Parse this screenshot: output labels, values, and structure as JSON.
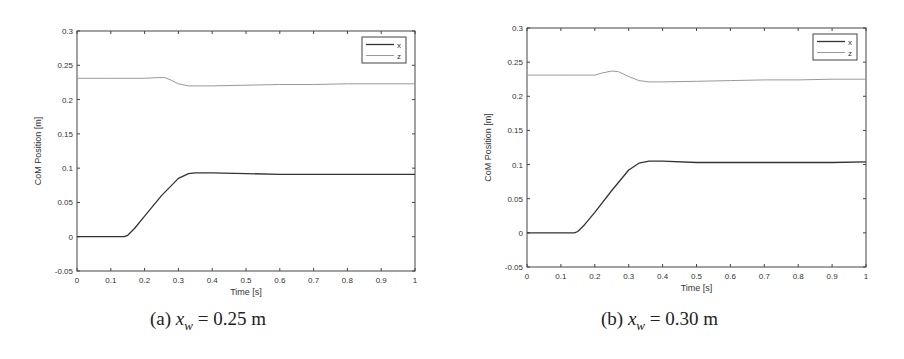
{
  "figures": [
    {
      "id": "a",
      "caption": {
        "label": "(a)",
        "var": "x",
        "sub": "w",
        "rest": "= 0.25 m"
      }
    },
    {
      "id": "b",
      "caption": {
        "label": "(b)",
        "var": "x",
        "sub": "w",
        "rest": "= 0.30 m"
      }
    }
  ],
  "chart_data": [
    {
      "type": "line",
      "title": "",
      "caption": "(a) x_w = 0.25 m",
      "xlabel": "Time [s]",
      "ylabel": "CoM Position [m]",
      "xlim": [
        0,
        1
      ],
      "ylim": [
        -0.05,
        0.3
      ],
      "xticks": [
        0,
        0.1,
        0.2,
        0.3,
        0.4,
        0.5,
        0.6,
        0.7,
        0.8,
        0.9,
        1
      ],
      "xtick_labels": [
        "0",
        "0.1",
        "0.2",
        "0.3",
        "0.4",
        "0.5",
        "0.6",
        "0.7",
        "0.8",
        "0.9",
        "1"
      ],
      "yticks": [
        -0.05,
        0,
        0.05,
        0.1,
        0.15,
        0.2,
        0.25,
        0.3
      ],
      "ytick_labels": [
        "-0.05",
        "0",
        "0.05",
        "0.1",
        "0.15",
        "0.2",
        "0.25",
        "0.3"
      ],
      "grid": false,
      "legend_position": "upper right",
      "series": [
        {
          "name": "x",
          "color": "#333333",
          "x": [
            0,
            0.1,
            0.14,
            0.15,
            0.17,
            0.2,
            0.25,
            0.3,
            0.33,
            0.35,
            0.4,
            0.5,
            0.6,
            0.7,
            0.8,
            0.9,
            1.0
          ],
          "y": [
            0,
            0,
            0,
            0.002,
            0.012,
            0.03,
            0.06,
            0.085,
            0.092,
            0.093,
            0.093,
            0.092,
            0.091,
            0.091,
            0.091,
            0.091,
            0.091
          ]
        },
        {
          "name": "z",
          "color": "#999999",
          "x": [
            0,
            0.1,
            0.2,
            0.24,
            0.26,
            0.28,
            0.3,
            0.33,
            0.36,
            0.4,
            0.5,
            0.6,
            0.7,
            0.8,
            0.9,
            1.0
          ],
          "y": [
            0.231,
            0.231,
            0.231,
            0.232,
            0.232,
            0.228,
            0.223,
            0.22,
            0.22,
            0.22,
            0.221,
            0.222,
            0.222,
            0.223,
            0.223,
            0.223
          ]
        }
      ],
      "annotations": []
    },
    {
      "type": "line",
      "title": "",
      "caption": "(b) x_w = 0.30 m",
      "xlabel": "Time [s]",
      "ylabel": "CoM Position [m]",
      "xlim": [
        0,
        1
      ],
      "ylim": [
        -0.05,
        0.3
      ],
      "xticks": [
        0,
        0.1,
        0.2,
        0.3,
        0.4,
        0.5,
        0.6,
        0.7,
        0.8,
        0.9,
        1
      ],
      "xtick_labels": [
        "0",
        "0.1",
        "0.2",
        "0.3",
        "0.4",
        "0.5",
        "0.6",
        "0.7",
        "0.8",
        "0.9",
        "1"
      ],
      "yticks": [
        -0.05,
        0,
        0.05,
        0.1,
        0.15,
        0.2,
        0.25,
        0.3
      ],
      "ytick_labels": [
        "-0.05",
        "0",
        "0.05",
        "0.1",
        "0.15",
        "0.2",
        "0.25",
        "0.3"
      ],
      "grid": false,
      "legend_position": "upper right",
      "series": [
        {
          "name": "x",
          "color": "#333333",
          "x": [
            0,
            0.1,
            0.14,
            0.15,
            0.17,
            0.2,
            0.25,
            0.3,
            0.33,
            0.36,
            0.4,
            0.5,
            0.6,
            0.7,
            0.8,
            0.9,
            1.0
          ],
          "y": [
            0,
            0,
            0,
            0.002,
            0.012,
            0.03,
            0.062,
            0.092,
            0.102,
            0.105,
            0.105,
            0.103,
            0.103,
            0.103,
            0.103,
            0.103,
            0.104
          ]
        },
        {
          "name": "z",
          "color": "#999999",
          "x": [
            0,
            0.1,
            0.2,
            0.22,
            0.25,
            0.27,
            0.3,
            0.33,
            0.36,
            0.4,
            0.5,
            0.6,
            0.7,
            0.8,
            0.9,
            1.0
          ],
          "y": [
            0.231,
            0.231,
            0.231,
            0.234,
            0.237,
            0.236,
            0.229,
            0.223,
            0.221,
            0.221,
            0.222,
            0.223,
            0.224,
            0.224,
            0.225,
            0.225
          ]
        }
      ],
      "annotations": []
    }
  ]
}
